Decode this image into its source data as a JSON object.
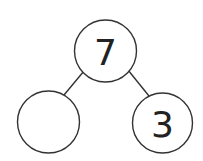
{
  "diagram": {
    "type": "number-bond",
    "whole": "7",
    "parts": [
      "",
      "3"
    ]
  }
}
